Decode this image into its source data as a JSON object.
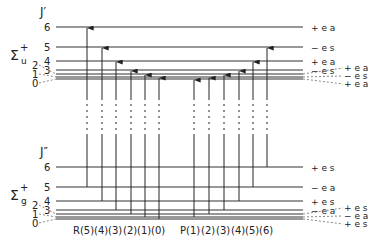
{
  "upper": {
    "j_label": "J′",
    "state_label": "Σ",
    "state_sup": "+",
    "state_sub": "u",
    "levels": [
      {
        "J": "6",
        "y": 27,
        "sym": "+ e a"
      },
      {
        "J": "5",
        "y": 47,
        "sym": "− e s"
      },
      {
        "J": "4",
        "y": 61,
        "sym": "+ e a"
      },
      {
        "J": "3",
        "y": 70,
        "sym": "− e s"
      },
      {
        "J": "2",
        "y": 74,
        "sym": "+ e a"
      },
      {
        "J": "1",
        "y": 77,
        "sym": "− e s"
      },
      {
        "J": "0",
        "y": 79,
        "sym": "+ e a"
      }
    ]
  },
  "lower": {
    "j_label": "J″",
    "state_label": "Σ",
    "state_sup": "+",
    "state_sub": "g",
    "levels": [
      {
        "J": "6",
        "y": 167,
        "sym": "+ e s"
      },
      {
        "J": "5",
        "y": 187,
        "sym": "− e a"
      },
      {
        "J": "4",
        "y": 201,
        "sym": "+ e s"
      },
      {
        "J": "3",
        "y": 210,
        "sym": "− e a"
      },
      {
        "J": "2",
        "y": 214,
        "sym": "+ e s"
      },
      {
        "J": "1",
        "y": 217,
        "sym": "− e a"
      },
      {
        "J": "0",
        "y": 219,
        "sym": "+ e s"
      }
    ]
  },
  "branches": {
    "R": [
      {
        "label": "R(5)",
        "x": 87,
        "from_J": 5,
        "to_J": 6
      },
      {
        "label": "(4)",
        "x": 102,
        "from_J": 4,
        "to_J": 5
      },
      {
        "label": "(3)",
        "x": 116,
        "from_J": 3,
        "to_J": 4
      },
      {
        "label": "(2)",
        "x": 131,
        "from_J": 2,
        "to_J": 3
      },
      {
        "label": "(1)",
        "x": 145,
        "from_J": 1,
        "to_J": 2
      },
      {
        "label": "(0)",
        "x": 159,
        "from_J": 0,
        "to_J": 1
      }
    ],
    "P": [
      {
        "label": "P(1)",
        "x": 194,
        "from_J": 1,
        "to_J": 0
      },
      {
        "label": "(2)",
        "x": 209,
        "from_J": 2,
        "to_J": 1
      },
      {
        "label": "(3)",
        "x": 224,
        "from_J": 3,
        "to_J": 2
      },
      {
        "label": "(4)",
        "x": 239,
        "from_J": 4,
        "to_J": 3
      },
      {
        "label": "(5)",
        "x": 253,
        "from_J": 5,
        "to_J": 4
      },
      {
        "label": "(6)",
        "x": 267,
        "from_J": 6,
        "to_J": 5
      }
    ]
  }
}
